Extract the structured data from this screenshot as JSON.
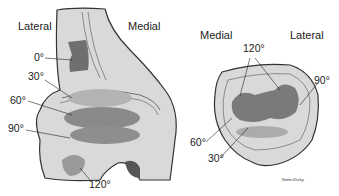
{
  "femur": {
    "labels": {
      "lateral": "Lateral",
      "medial": "Medial"
    },
    "angles": [
      "0°",
      "30°",
      "60°",
      "90°",
      "120°"
    ]
  },
  "patella": {
    "labels": {
      "medial": "Medial",
      "lateral": "Lateral"
    },
    "angles": {
      "top": "120°",
      "right": "90°",
      "left": "60°",
      "bottom": "30°"
    }
  },
  "signature": "Netter/Dicky",
  "colors": {
    "bone": "#d9d9d9",
    "outline": "#333333",
    "contact_dark": "#7a7a7a",
    "contact_mid": "#9a9a9a",
    "contact_light": "#b3b3b3"
  }
}
